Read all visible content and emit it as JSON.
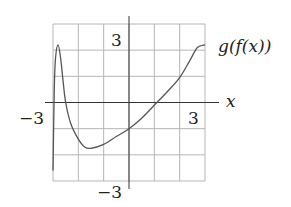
{
  "chart_data": {
    "type": "line",
    "title": "",
    "xlabel": "x",
    "ylabel": "",
    "xlim": [
      -3,
      3
    ],
    "ylim": [
      -3,
      3
    ],
    "grid": true,
    "grid_step": 1,
    "tick_labels": {
      "x": [
        "-3",
        "3"
      ],
      "y": [
        "3",
        "-3"
      ]
    },
    "series": [
      {
        "name": "g(f(x))",
        "x": [
          -3.0,
          -2.95,
          -2.9,
          -2.8,
          -2.7,
          -2.6,
          -2.5,
          -2.3,
          -2.0,
          -1.75,
          -1.5,
          -1.0,
          -0.5,
          0.0,
          0.5,
          1.1,
          1.5,
          2.0,
          2.4,
          2.7,
          3.0
        ],
        "y": [
          -2.6,
          0.5,
          1.7,
          2.2,
          1.7,
          0.8,
          0.0,
          -0.8,
          -1.4,
          -1.7,
          -1.75,
          -1.6,
          -1.3,
          -1.0,
          -0.6,
          0.0,
          0.4,
          0.95,
          1.6,
          2.1,
          2.2
        ]
      }
    ],
    "annotations": [
      {
        "text": "g(f(x))",
        "position": "right of curve end"
      }
    ]
  },
  "labels": {
    "x_axis": "x",
    "x_min": "−3",
    "x_max": "3",
    "y_max": "3",
    "y_min": "−3",
    "curve": "g(f(x))"
  }
}
